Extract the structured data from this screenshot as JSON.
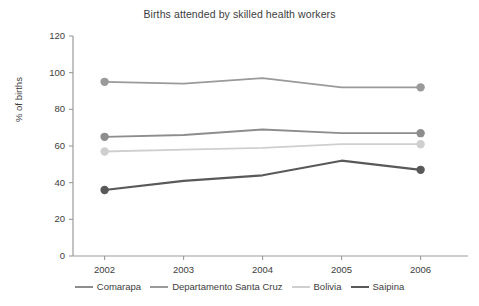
{
  "chart_data": {
    "type": "line",
    "title": "Births attended by skilled health workers",
    "xlabel": "",
    "ylabel": "% of births",
    "categories": [
      "2002",
      "2003",
      "2004",
      "2005",
      "2006"
    ],
    "x": [
      2002,
      2003,
      2004,
      2005,
      2006
    ],
    "ylim": [
      0,
      120
    ],
    "ytick_labels": [
      "0",
      "20",
      "40",
      "60",
      "80",
      "100",
      "120"
    ],
    "yticks": [
      0,
      20,
      40,
      60,
      80,
      100,
      120
    ],
    "grid": false,
    "legend_position": "bottom",
    "series": [
      {
        "name": "Comarapa",
        "color": "#8d8d8d",
        "values": [
          65,
          66,
          69,
          67,
          67
        ],
        "markers_at": [
          "2002",
          "2006"
        ]
      },
      {
        "name": "Departamento Santa Cruz",
        "color": "#9a9a9a",
        "values": [
          95,
          94,
          97,
          92,
          92
        ],
        "markers_at": [
          "2002",
          "2006"
        ]
      },
      {
        "name": "Bolivia",
        "color": "#cfcfcf",
        "values": [
          57,
          58,
          59,
          61,
          61
        ],
        "markers_at": [
          "2002",
          "2006"
        ]
      },
      {
        "name": "Saipina",
        "color": "#595959",
        "values": [
          36,
          41,
          44,
          52,
          47
        ],
        "markers_at": [
          "2002",
          "2006"
        ]
      }
    ]
  },
  "legend": {
    "items": [
      {
        "label": "Comarapa",
        "color": "#8d8d8d",
        "width": "2px"
      },
      {
        "label": "Departamento Santa Cruz",
        "color": "#9a9a9a",
        "width": "2px"
      },
      {
        "label": "Bolivia",
        "color": "#cfcfcf",
        "width": "2px"
      },
      {
        "label": "Saipina",
        "color": "#595959",
        "width": "2.4px"
      }
    ]
  },
  "axes": {
    "axis_color": "#9b9b9b",
    "tick_color": "#9b9b9b"
  }
}
